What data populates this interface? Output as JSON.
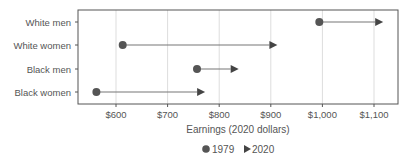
{
  "chart_data": {
    "type": "dumbbell",
    "title": "",
    "xlabel": "Earnings (2020 dollars)",
    "ylabel": "",
    "xlim": [
      525,
      1150
    ],
    "x_ticks": [
      600,
      700,
      800,
      900,
      1000,
      1100
    ],
    "x_tick_labels": [
      "$600",
      "$700",
      "$800",
      "$900",
      "$1,000",
      "$1,100"
    ],
    "grid": "vertical",
    "legend_position": "bottom",
    "categories": [
      "White men",
      "White women",
      "Black men",
      "Black women"
    ],
    "series": [
      {
        "name": "1979",
        "marker": "circle",
        "values": [
          994,
          613,
          757,
          562
        ]
      },
      {
        "name": "2020",
        "marker": "triangle-right",
        "values": [
          1110,
          905,
          830,
          765
        ]
      }
    ],
    "colors": {
      "marker": "#555555",
      "line": "#777777",
      "grid": "#dddddd",
      "frame": "#555555",
      "text": "#555555"
    }
  },
  "legend": {
    "items": [
      {
        "label": "1979",
        "icon": "circle-icon"
      },
      {
        "label": "2020",
        "icon": "triangle-right-icon"
      }
    ]
  }
}
